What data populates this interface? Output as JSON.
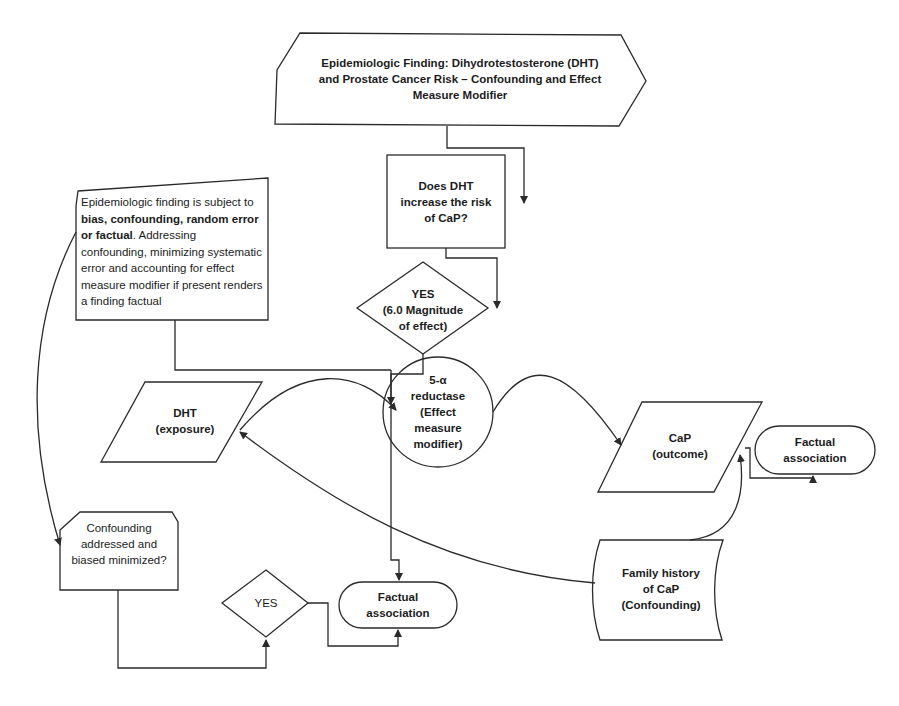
{
  "title": {
    "line1": "Epidemiologic Finding: Dihydrotestosterone (DHT)",
    "line2": "and Prostate Cancer Risk – Confounding and Effect",
    "line3": "Measure Modifier"
  },
  "question": {
    "line1": "Does DHT",
    "line2": "increase the risk",
    "line3": "of CaP?"
  },
  "decision_yes": {
    "line1": "YES",
    "line2": "(6.0 Magnitude",
    "line3": "of effect)"
  },
  "note": {
    "pre": "Epidemiologic finding is subject to ",
    "bold": "bias, confounding, random error or factual",
    "post": ". Addressing confounding, minimizing systematic error and accounting for effect measure modifier if present renders a finding factual"
  },
  "exposure": {
    "line1": "DHT",
    "line2": "(exposure)"
  },
  "modifier": {
    "line1": "5-α",
    "line2": "reductase",
    "line3": "(Effect",
    "line4": "measure",
    "line5": "modifier)"
  },
  "outcome": {
    "line1": "CaP",
    "line2": "(outcome)"
  },
  "factual_right": {
    "line1": "Factual",
    "line2": "association"
  },
  "confounder": {
    "line1": "Family history",
    "line2": "of CaP",
    "line3": "(Confounding)"
  },
  "confounding_check": {
    "line1": "Confounding",
    "line2": "addressed and",
    "line3": "biased minimized?"
  },
  "decision_yes_bottom": {
    "label": "YES"
  },
  "factual_bottom": {
    "line1": "Factual",
    "line2": "association"
  },
  "colors": {
    "stroke": "#2a2a2a",
    "background": "#ffffff",
    "text": "#1c1c1c"
  }
}
